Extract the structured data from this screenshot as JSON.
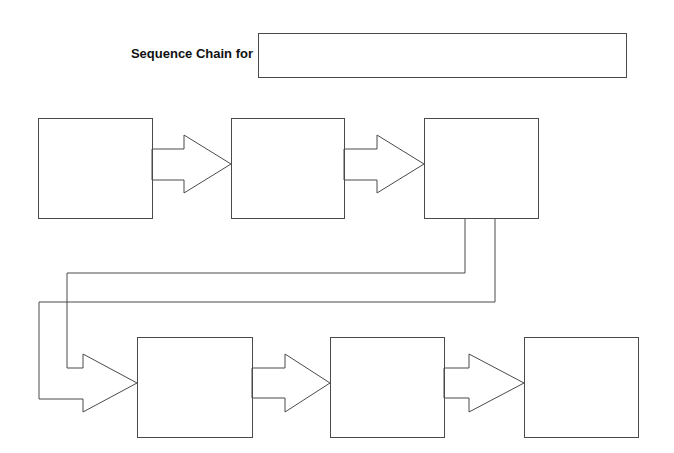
{
  "header": {
    "title_label": "Sequence Chain for",
    "title_value": "",
    "title_placeholder": ""
  },
  "diagram": {
    "stroke_color": "#4a4a4a",
    "background_color": "#ffffff",
    "rows": [
      {
        "boxes": [
          {
            "id": 1,
            "text": ""
          },
          {
            "id": 2,
            "text": ""
          },
          {
            "id": 3,
            "text": ""
          }
        ]
      },
      {
        "boxes": [
          {
            "id": 4,
            "text": ""
          },
          {
            "id": 5,
            "text": ""
          },
          {
            "id": 6,
            "text": ""
          }
        ]
      }
    ],
    "arrows": [
      {
        "from": 1,
        "to": 2,
        "type": "block-arrow"
      },
      {
        "from": 2,
        "to": 3,
        "type": "block-arrow"
      },
      {
        "from": 3,
        "to": 4,
        "type": "elbow-block-arrow"
      },
      {
        "from": 4,
        "to": 5,
        "type": "block-arrow"
      },
      {
        "from": 5,
        "to": 6,
        "type": "block-arrow"
      }
    ]
  }
}
